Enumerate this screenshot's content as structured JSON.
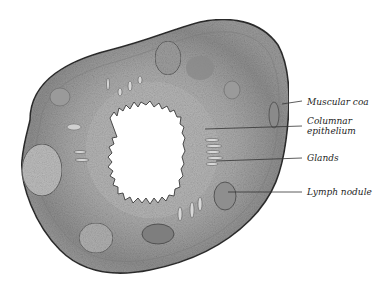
{
  "figure": {
    "colors": {
      "outer_wall": "#8c8c8c",
      "tissue": "#a8a8a8",
      "mucosa": "#b4b4b4",
      "lumen": "#ffffff",
      "outline": "#3a3a3a",
      "label_line": "#333333"
    }
  },
  "labels": [
    {
      "id": "muscular-coat",
      "text": "Muscular coa",
      "x": 307,
      "y": 97
    },
    {
      "id": "columnar-epithelium-1",
      "text": "Columnar",
      "x": 307,
      "y": 116
    },
    {
      "id": "columnar-epithelium-2",
      "text": "epithelium",
      "x": 307,
      "y": 126
    },
    {
      "id": "glands",
      "text": "Glands",
      "x": 307,
      "y": 153
    },
    {
      "id": "lymph-nodule",
      "text": "Lymph nodule",
      "x": 307,
      "y": 187
    }
  ]
}
